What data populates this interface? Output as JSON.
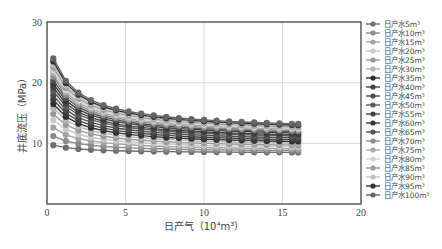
{
  "chart_data": {
    "type": "line",
    "title": "",
    "xlabel": "日产气（10⁴m³）",
    "ylabel": "井底流压（MPa）",
    "xlim": [
      0,
      20
    ],
    "ylim": [
      0,
      30
    ],
    "xticks": [
      0,
      5,
      10,
      15,
      20
    ],
    "yticks": [
      10,
      20,
      30
    ],
    "grid": true,
    "legend_position": "right",
    "x": [
      0.4,
      1.2,
      2.0,
      2.8,
      3.6,
      4.4,
      5.2,
      6.0,
      6.8,
      7.6,
      8.4,
      9.2,
      10.0,
      10.8,
      11.6,
      12.4,
      13.2,
      14.0,
      14.8,
      15.6,
      16.0
    ],
    "series": [
      {
        "name": "日产水5m³",
        "color": "#6e6e6e",
        "start": 9.7,
        "end": 8.5
      },
      {
        "name": "日产水10m³",
        "color": "#8a8a8a",
        "start": 11.2,
        "end": 8.8
      },
      {
        "name": "日产水15m³",
        "color": "#a3a3a3",
        "start": 12.6,
        "end": 9.1
      },
      {
        "name": "日产水20m³",
        "color": "#c9c9c9",
        "start": 13.8,
        "end": 9.4
      },
      {
        "name": "日产水25m³",
        "color": "#999999",
        "start": 14.8,
        "end": 9.7
      },
      {
        "name": "日产水30m³",
        "color": "#b5b5b5",
        "start": 15.8,
        "end": 10.0
      },
      {
        "name": "日产水35m³",
        "color": "#2e2e2e",
        "start": 16.5,
        "end": 10.3
      },
      {
        "name": "日产水40m³",
        "color": "#3f3f3f",
        "start": 17.2,
        "end": 10.6
      },
      {
        "name": "日产水45m³",
        "color": "#4a4a4a",
        "start": 17.9,
        "end": 10.9
      },
      {
        "name": "日产水50m³",
        "color": "#5a5a5a",
        "start": 18.6,
        "end": 11.2
      },
      {
        "name": "日产水55m³",
        "color": "#444444",
        "start": 19.2,
        "end": 11.4
      },
      {
        "name": "日产水60m³",
        "color": "#383838",
        "start": 19.8,
        "end": 11.7
      },
      {
        "name": "日产水65m³",
        "color": "#555555",
        "start": 20.4,
        "end": 11.9
      },
      {
        "name": "日产水70m³",
        "color": "#8c8c8c",
        "start": 21.0,
        "end": 12.1
      },
      {
        "name": "日产水75m³",
        "color": "#a8a8a8",
        "start": 21.5,
        "end": 12.3
      },
      {
        "name": "日产水80m³",
        "color": "#d2d2d2",
        "start": 22.0,
        "end": 12.5
      },
      {
        "name": "日产水85m³",
        "color": "#9a9a9a",
        "start": 22.5,
        "end": 12.7
      },
      {
        "name": "日产水90m³",
        "color": "#c0c0c0",
        "start": 23.0,
        "end": 12.9
      },
      {
        "name": "日产水95m³",
        "color": "#333333",
        "start": 23.5,
        "end": 13.0
      },
      {
        "name": "日产水100m³",
        "color": "#666666",
        "start": 24.0,
        "end": 13.2
      }
    ]
  }
}
